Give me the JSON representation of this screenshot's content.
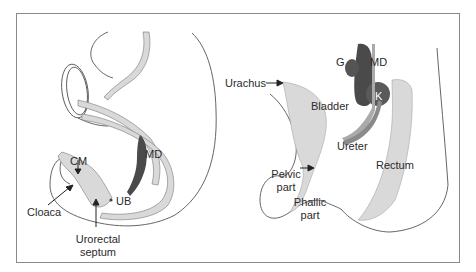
{
  "figure": {
    "frame_color": "#8a8a8a",
    "tissue_fill": "#d9d9d9",
    "duct_fill": "#4a4a4a",
    "kidney_fill": "#5a5a5a",
    "outline_color": "#555555"
  },
  "left_panel": {
    "labels": {
      "cm": "CM",
      "md": "MD",
      "ub": "UB",
      "cloaca": "Cloaca",
      "urorectal_line1": "Urorectal",
      "urorectal_line2": "septum"
    }
  },
  "right_panel": {
    "labels": {
      "urachus": "Urachus",
      "g": "G",
      "md": "MD",
      "k": "K",
      "bladder": "Bladder",
      "ureter": "Ureter",
      "pelvic_line1": "Pelvic",
      "pelvic_line2": "part",
      "rectum": "Rectum",
      "phallic_line1": "Phallic",
      "phallic_line2": "part"
    }
  }
}
